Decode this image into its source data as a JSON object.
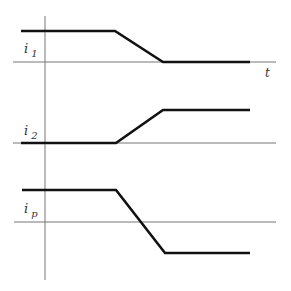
{
  "diagram": {
    "type": "timing-waveforms",
    "colors": {
      "axis": "#777777",
      "signal": "#111111",
      "text": "#333333"
    },
    "time_axis_label": "t",
    "vertical_axis": {
      "x": 45,
      "y1": 16,
      "y2": 280
    },
    "waveforms": [
      {
        "name": "i1",
        "label_main": "i",
        "label_sub": "1",
        "baseline": {
          "x1": 13,
          "x2": 276,
          "y": 62
        },
        "points": "21,31 115,31 163,62 250,62",
        "label_pos": {
          "x": 24,
          "y": 53
        }
      },
      {
        "name": "i2",
        "label_main": "i",
        "label_sub": "2",
        "baseline": {
          "x1": 13,
          "x2": 276,
          "y": 143
        },
        "points": "21,143 116,143 163,110 250,110",
        "label_pos": {
          "x": 24,
          "y": 135
        }
      },
      {
        "name": "ip",
        "label_main": "i",
        "label_sub": "p",
        "baseline": {
          "x1": 14,
          "x2": 276,
          "y": 222
        },
        "points": "22,190 116,190 165,253 250,253",
        "label_pos": {
          "x": 24,
          "y": 213
        }
      }
    ],
    "t_label_pos": {
      "x": 265,
      "y": 77
    }
  }
}
